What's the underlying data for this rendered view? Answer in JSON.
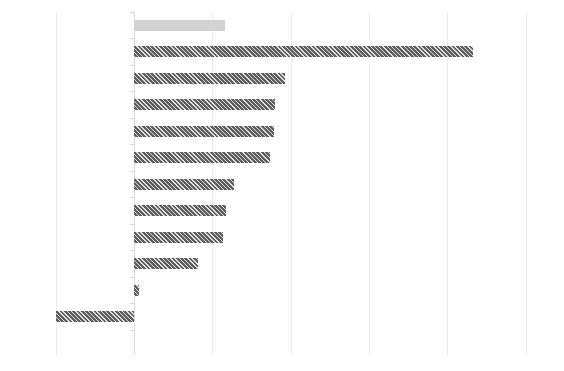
{
  "chart": {
    "title": "",
    "subtitle": "",
    "xlabel": "",
    "ylabel": ""
  },
  "chart_data": {
    "type": "bar",
    "orientation": "horizontal",
    "title": "",
    "subtitle": "",
    "xlabel": "",
    "ylabel": "",
    "grid": true,
    "grid_axis": "x",
    "legend": false,
    "legend_position": "none",
    "xlim": [
      -1.0,
      5.0
    ],
    "xticks": [
      -1,
      0,
      1,
      2,
      3,
      4,
      5
    ],
    "xticklabels": [
      "",
      "",
      "",
      "",
      "",
      "",
      ""
    ],
    "categories": [
      "",
      "",
      "",
      "",
      "",
      "",
      "",
      "",
      "",
      "",
      "",
      ""
    ],
    "values": [
      1.16,
      4.33,
      1.93,
      1.8,
      1.79,
      1.74,
      1.28,
      1.17,
      1.14,
      0.82,
      0.06,
      -1.0
    ],
    "bar_colors": [
      "#d2d2d2",
      "#5c5c5c",
      "#5c5c5c",
      "#5c5c5c",
      "#5c5c5c",
      "#5c5c5c",
      "#5c5c5c",
      "#5c5c5c",
      "#5c5c5c",
      "#5c5c5c",
      "#5c5c5c",
      "#5c5c5c"
    ],
    "bar_styles": [
      "plain",
      "hatched",
      "hatched",
      "hatched",
      "hatched",
      "hatched",
      "hatched",
      "hatched",
      "hatched",
      "hatched",
      "hatched",
      "hatched"
    ],
    "colors": {
      "highlight_bar": "#d2d2d2",
      "bar": "#5c5c5c",
      "gridline": "#ebebeb",
      "axis": "#d8d8d8",
      "background": "#ffffff"
    }
  },
  "layout": {
    "plot_left_px": 56,
    "plot_right_px": 526,
    "plot_top_px": 12,
    "plot_bottom_px": 355,
    "zero_x_px": 134,
    "unit_px": 78.3,
    "bar_pitch_px": 26.5,
    "bar_height_px": 11,
    "first_bar_center_px": 25
  }
}
